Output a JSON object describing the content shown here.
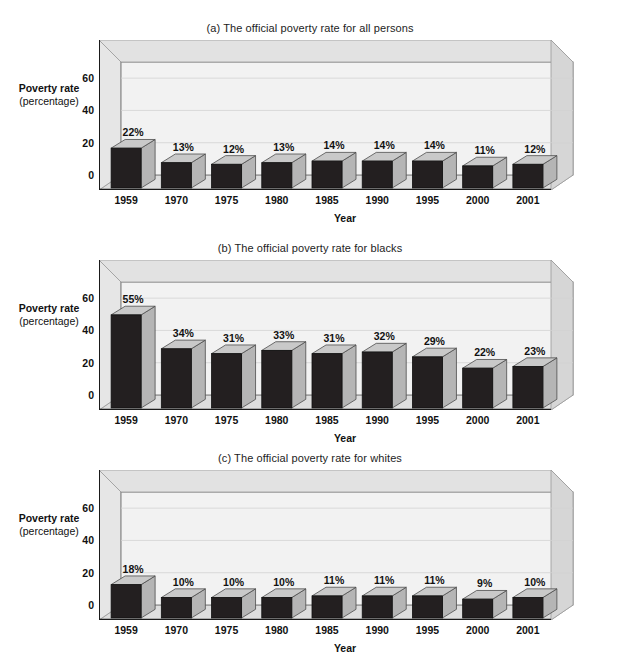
{
  "figure": {
    "axis_y_label_line1": "Poverty rate",
    "axis_y_label_line2": "(percentage)",
    "axis_x_label": "Year",
    "y_ticks": [
      "0",
      "20",
      "40",
      "60"
    ],
    "categories": [
      "1959",
      "1970",
      "1975",
      "1980",
      "1985",
      "1990",
      "1995",
      "2000",
      "2001"
    ]
  },
  "chart_data": [
    {
      "type": "bar",
      "title": "(a) The official poverty rate for all persons",
      "xlabel": "Year",
      "ylabel": "Poverty rate (percentage)",
      "categories": [
        "1959",
        "1970",
        "1975",
        "1980",
        "1985",
        "1990",
        "1995",
        "2000",
        "2001"
      ],
      "values": [
        22,
        13,
        12,
        13,
        14,
        14,
        14,
        11,
        12
      ],
      "data_labels": [
        "22%",
        "13%",
        "12%",
        "13%",
        "14%",
        "14%",
        "14%",
        "11%",
        "12%"
      ],
      "ylim": [
        0,
        70
      ],
      "yticks": [
        0,
        20,
        40,
        60
      ],
      "grid": true,
      "legend": "none",
      "bar_face_color": "#231f20",
      "bar_top_color": "#c9c9c9",
      "bar_side_color": "#b5b5b5"
    },
    {
      "type": "bar",
      "title": "(b) The official poverty rate for blacks",
      "xlabel": "Year",
      "ylabel": "Poverty rate (percentage)",
      "categories": [
        "1959",
        "1970",
        "1975",
        "1980",
        "1985",
        "1990",
        "1995",
        "2000",
        "2001"
      ],
      "values": [
        55,
        34,
        31,
        33,
        31,
        32,
        29,
        22,
        23
      ],
      "data_labels": [
        "55%",
        "34%",
        "31%",
        "33%",
        "31%",
        "32%",
        "29%",
        "22%",
        "23%"
      ],
      "ylim": [
        0,
        70
      ],
      "yticks": [
        0,
        20,
        40,
        60
      ],
      "grid": true,
      "legend": "none",
      "bar_face_color": "#231f20",
      "bar_top_color": "#c9c9c9",
      "bar_side_color": "#b5b5b5"
    },
    {
      "type": "bar",
      "title": "(c) The official poverty rate for whites",
      "xlabel": "Year",
      "ylabel": "Poverty rate (percentage)",
      "categories": [
        "1959",
        "1970",
        "1975",
        "1980",
        "1985",
        "1990",
        "1995",
        "2000",
        "2001"
      ],
      "values": [
        18,
        10,
        10,
        10,
        11,
        11,
        11,
        9,
        10
      ],
      "data_labels": [
        "18%",
        "10%",
        "10%",
        "10%",
        "11%",
        "11%",
        "11%",
        "9%",
        "10%"
      ],
      "ylim": [
        0,
        70
      ],
      "yticks": [
        0,
        20,
        40,
        60
      ],
      "grid": true,
      "legend": "none",
      "bar_face_color": "#231f20",
      "bar_top_color": "#c9c9c9",
      "bar_side_color": "#b5b5b5"
    }
  ]
}
